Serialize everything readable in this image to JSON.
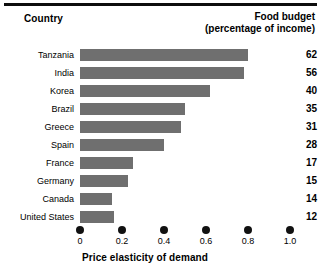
{
  "header": {
    "country_label": "Country",
    "value_label_line1": "Food budget",
    "value_label_line2": "(percentage of income)"
  },
  "axis": {
    "title": "Price elasticity of demand",
    "ticks": [
      "0",
      "0.2",
      "0.4",
      "0.6",
      "0.8",
      "1.0"
    ]
  },
  "colors": {
    "bar": "#6f6f6f",
    "rule": "#0d0d0d",
    "text": "#000000"
  },
  "chart_data": {
    "type": "bar",
    "orientation": "horizontal",
    "title": "",
    "xlabel": "Price elasticity of demand",
    "ylabel": "Country",
    "xlim": [
      0,
      1.0
    ],
    "xticks": [
      0,
      0.2,
      0.4,
      0.6,
      0.8,
      1.0
    ],
    "grid": false,
    "legend": "none",
    "categories": [
      "Tanzania",
      "India",
      "Korea",
      "Brazil",
      "Greece",
      "Spain",
      "France",
      "Germany",
      "Canada",
      "United States"
    ],
    "values": [
      0.8,
      0.78,
      0.62,
      0.5,
      0.48,
      0.4,
      0.25,
      0.23,
      0.15,
      0.16
    ],
    "series": [
      {
        "name": "Price elasticity of demand",
        "values": [
          0.8,
          0.78,
          0.62,
          0.5,
          0.48,
          0.4,
          0.25,
          0.23,
          0.15,
          0.16
        ]
      },
      {
        "name": "Food budget (percentage of income)",
        "values": [
          62,
          56,
          40,
          35,
          31,
          28,
          17,
          15,
          14,
          12
        ]
      }
    ],
    "data_labels": [
      "62",
      "56",
      "40",
      "35",
      "31",
      "28",
      "17",
      "15",
      "14",
      "12"
    ]
  }
}
